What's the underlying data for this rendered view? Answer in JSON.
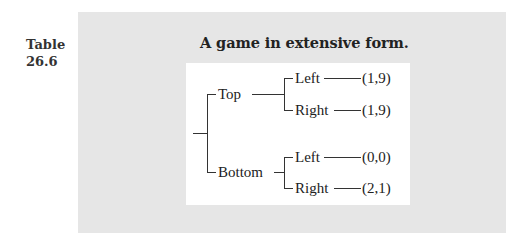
{
  "table": {
    "label_line1": "Table",
    "label_line2": "26.6",
    "caption": "A game in extensive form."
  },
  "tree": {
    "root": "",
    "branches": [
      {
        "label": "Top",
        "children": [
          {
            "label": "Left",
            "payoff": "(1,9)"
          },
          {
            "label": "Right",
            "payoff": "(1,9)"
          }
        ]
      },
      {
        "label": "Bottom",
        "children": [
          {
            "label": "Left",
            "payoff": "(0,0)"
          },
          {
            "label": "Right",
            "payoff": "(2,1)"
          }
        ]
      }
    ]
  },
  "colors": {
    "panel_background": "#e6e6e6",
    "tree_background": "#ffffff",
    "line_color": "#333333"
  }
}
